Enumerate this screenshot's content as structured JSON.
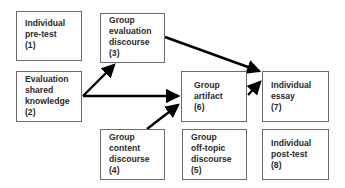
{
  "diagram": {
    "type": "flow",
    "nodes": [
      {
        "id": 1,
        "lines": [
          "Individual",
          "pre-test",
          "(1)"
        ]
      },
      {
        "id": 2,
        "lines": [
          "Evaluation",
          "shared",
          "knowledge",
          "(2)"
        ]
      },
      {
        "id": 3,
        "lines": [
          "Group",
          "evaluation",
          "discourse",
          "(3)"
        ]
      },
      {
        "id": 4,
        "lines": [
          "Group",
          "content",
          "discourse",
          "(4)"
        ]
      },
      {
        "id": 5,
        "lines": [
          "Group",
          "off-topic",
          "discourse",
          "(5)"
        ]
      },
      {
        "id": 6,
        "lines": [
          "Group",
          "artifact",
          "(6)"
        ]
      },
      {
        "id": 7,
        "lines": [
          "Individual",
          "essay",
          "(7)"
        ]
      },
      {
        "id": 8,
        "lines": [
          "Individual",
          "post-test",
          "(8)"
        ]
      }
    ],
    "edges": [
      {
        "from": 2,
        "to": 3
      },
      {
        "from": 2,
        "to": 6
      },
      {
        "from": 4,
        "to": 6
      },
      {
        "from": 3,
        "to": 7
      },
      {
        "from": 6,
        "to": 7
      }
    ],
    "colors": {
      "border": "#6b6b6b",
      "text": "#2a2a2a",
      "arrow": "#000000",
      "background": "#ffffff"
    }
  }
}
